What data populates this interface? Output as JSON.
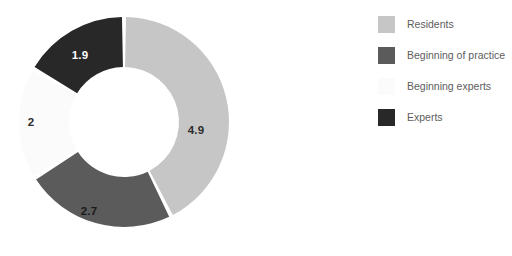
{
  "chart_data": {
    "type": "pie",
    "variant": "donut",
    "title": "",
    "xlabel": "",
    "ylabel": "",
    "total": 11.5,
    "grid": false,
    "legend_position": "right",
    "data_labels_shown": true,
    "categories": [
      "Residents",
      "Beginning of practice",
      "Beginning experts",
      "Experts"
    ],
    "values": [
      4.9,
      2.7,
      2,
      1.9
    ],
    "slices": [
      {
        "label": "Residents",
        "value": 4.9,
        "display_value": "4.9",
        "color": "#c6c6c6",
        "label_color": "#2b2b2b",
        "start_angle": 0,
        "end_angle": 153.4,
        "label_x": 196,
        "label_y": 131
      },
      {
        "label": "Beginning of practice",
        "value": 2.7,
        "display_value": "2.7",
        "color": "#5b5b5b",
        "label_color": "#1a1a1a",
        "start_angle": 153.4,
        "end_angle": 237.9,
        "label_x": 89,
        "label_y": 212
      },
      {
        "label": "Beginning experts",
        "value": 2,
        "display_value": "2",
        "color": "#fbfbfb",
        "label_color": "#2b2b2b",
        "start_angle": 237.9,
        "end_angle": 300.5,
        "label_x": 31,
        "label_y": 123
      },
      {
        "label": "Experts",
        "value": 1.9,
        "display_value": "1.9",
        "color": "#282828",
        "label_color": "#ffffff",
        "start_angle": 300.5,
        "end_angle": 360,
        "label_x": 80,
        "label_y": 56
      }
    ],
    "geometry": {
      "center_x": 124,
      "center_y": 122,
      "outer_radius": 105,
      "inner_radius": 55,
      "gap_degrees": 2.2
    }
  },
  "legend": {
    "items": [
      {
        "label": "Residents",
        "color": "#c6c6c6"
      },
      {
        "label": "Beginning of practice",
        "color": "#5b5b5b"
      },
      {
        "label": "Beginning experts",
        "color": "#fbfbfb"
      },
      {
        "label": "Experts",
        "color": "#282828"
      }
    ]
  }
}
